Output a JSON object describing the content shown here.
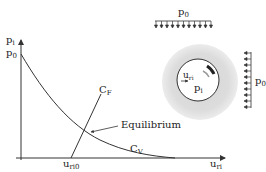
{
  "diagram": {
    "type": "convergence-confinement",
    "axes": {
      "y_label": "p",
      "y_label_sub": "i",
      "y_tick_label": "p",
      "y_tick_sub": "0",
      "x_label": "u",
      "x_label_sub": "ri",
      "x_tick_label": "u",
      "x_tick_sub": "ri0"
    },
    "curves": {
      "support": {
        "label": "C",
        "sub": "F"
      },
      "ground": {
        "label": "C",
        "sub": "V"
      }
    },
    "annotation": {
      "equilibrium": "Equilibrium"
    },
    "tunnel": {
      "displacement_label": "u",
      "displacement_sub": "ri",
      "pressure_label": "p",
      "pressure_sub": "i"
    },
    "loads": {
      "top": {
        "label": "p",
        "sub": "0",
        "arrow_count": 11
      },
      "right": {
        "label": "p",
        "sub": "0",
        "arrow_count": 10
      }
    },
    "colors": {
      "line": "#333333",
      "halo": "#d9d9d9",
      "background": "#ffffff"
    }
  }
}
